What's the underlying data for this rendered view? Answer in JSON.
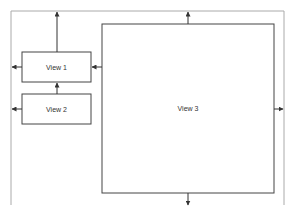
{
  "diagram": {
    "views": [
      {
        "id": "view1",
        "label": "View 1"
      },
      {
        "id": "view2",
        "label": "View 2"
      },
      {
        "id": "view3",
        "label": "View 3"
      }
    ],
    "colors": {
      "frame": "#aaaaaa",
      "box_stroke": "#444444",
      "arrow": "#333333"
    }
  }
}
